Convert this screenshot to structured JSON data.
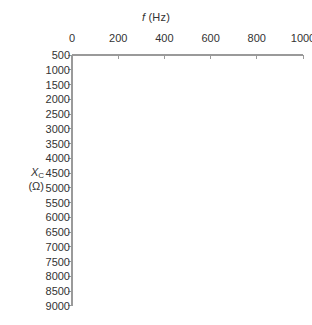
{
  "chart_data": {
    "type": "line",
    "title": "",
    "xlabel": "f (Hz)",
    "ylabel": "X_C (Ω)",
    "xlabel_symbol": "f",
    "xlabel_unit": "(Hz)",
    "ylabel_symbol": "X",
    "ylabel_subscript": "C",
    "ylabel_unit": "(Ω)",
    "x_ticks": [
      0,
      200,
      400,
      600,
      800,
      1000
    ],
    "x_tick_labels": [
      "0",
      "200",
      "400",
      "600",
      "800",
      "1000"
    ],
    "y_ticks": [
      500,
      1000,
      1500,
      2000,
      2500,
      3000,
      3500,
      4000,
      4500,
      5000,
      5500,
      6000,
      6500,
      7000,
      7500,
      8000,
      8500,
      9000
    ],
    "y_tick_labels": [
      "500",
      "1000",
      "1500",
      "2000",
      "2500",
      "3000",
      "3500",
      "4000",
      "4500",
      "5000",
      "5500",
      "6000",
      "6500",
      "7000",
      "7500",
      "8000",
      "8500",
      "9000"
    ],
    "xlim": [
      0,
      1000
    ],
    "ylim": [
      500,
      9000
    ],
    "y_axis_direction": "increasing-downward",
    "x_axis_position": "top",
    "grid": false,
    "legend": null,
    "series": [],
    "values": [],
    "categories": [],
    "annotations": [],
    "note": "blank plotting grid, no data drawn"
  },
  "style": {
    "background": "#ffffff",
    "axis_color": "#9a9a9a",
    "tick_color": "#9a9a9a",
    "text_color": "#333333"
  },
  "geometry": {
    "x_axis_y": 55,
    "x_origin": 72,
    "x_end": 303,
    "x_px_per_tick": 43,
    "y_start": 55,
    "y_px_per_tick": 14.75
  }
}
